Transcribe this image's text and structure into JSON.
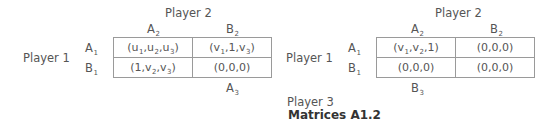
{
  "figure": {
    "caption": "Matrices A1.2",
    "player3_label": "Player 3"
  },
  "left_matrix": {
    "column_player": "Player 2",
    "row_player": "Player 1",
    "columns": [
      {
        "base": "A",
        "sub": "2"
      },
      {
        "base": "B",
        "sub": "2"
      }
    ],
    "rows": [
      {
        "base": "A",
        "sub": "1"
      },
      {
        "base": "B",
        "sub": "1"
      }
    ],
    "player3_strategy": {
      "base": "A",
      "sub": "3"
    },
    "cells": [
      [
        [
          {
            "t": "(u"
          },
          {
            "s": "1"
          },
          {
            "t": ",u"
          },
          {
            "s": "2"
          },
          {
            "t": ",u"
          },
          {
            "s": "3"
          },
          {
            "t": ")"
          }
        ],
        [
          {
            "t": "(v"
          },
          {
            "s": "1"
          },
          {
            "t": ",1,v"
          },
          {
            "s": "3"
          },
          {
            "t": ")"
          }
        ]
      ],
      [
        [
          {
            "t": "(1,v"
          },
          {
            "s": "2"
          },
          {
            "t": ",v"
          },
          {
            "s": "3"
          },
          {
            "t": ")"
          }
        ],
        [
          {
            "t": "(0,0,0)"
          }
        ]
      ]
    ]
  },
  "right_matrix": {
    "column_player": "Player 2",
    "row_player": "Player 1",
    "columns": [
      {
        "base": "A",
        "sub": "2"
      },
      {
        "base": "B",
        "sub": "2"
      }
    ],
    "rows": [
      {
        "base": "A",
        "sub": "1"
      },
      {
        "base": "B",
        "sub": "1"
      }
    ],
    "player3_strategy": {
      "base": "B",
      "sub": "3"
    },
    "cells": [
      [
        [
          {
            "t": "(v"
          },
          {
            "s": "1"
          },
          {
            "t": ",v"
          },
          {
            "s": "2"
          },
          {
            "t": ",1)"
          }
        ],
        [
          {
            "t": "(0,0,0)"
          }
        ]
      ],
      [
        [
          {
            "t": "(0,0,0)"
          }
        ],
        [
          {
            "t": "(0,0,0)"
          }
        ]
      ]
    ]
  }
}
